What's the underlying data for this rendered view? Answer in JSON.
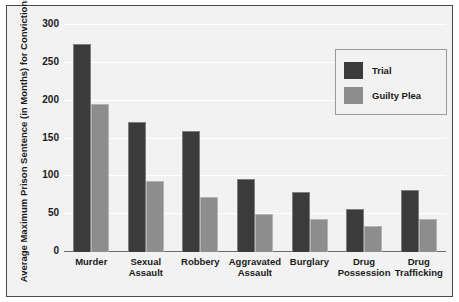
{
  "chart_data": {
    "type": "bar",
    "title": "",
    "xlabel": "",
    "ylabel": "Average Maximum Prison Sentence (in Months) for Convictions",
    "ylim": [
      0,
      300
    ],
    "ytick_step": 50,
    "yticks": [
      0,
      50,
      100,
      150,
      200,
      250,
      300
    ],
    "ytick_labels": [
      "0",
      "50",
      "100",
      "150",
      "200",
      "250",
      "300"
    ],
    "grid": true,
    "grid_axis": "y",
    "legend_position": "top-right",
    "categories": [
      "Murder",
      "Sexual Assault",
      "Robbery",
      "Aggravated Assault",
      "Burglary",
      "Drug Possession",
      "Drug Trafficking"
    ],
    "category_lines": [
      [
        "Murder"
      ],
      [
        "Sexual",
        "Assault"
      ],
      [
        "Robbery"
      ],
      [
        "Aggravated",
        "Assault"
      ],
      [
        "Burglary"
      ],
      [
        "Drug",
        "Possession"
      ],
      [
        "Drug",
        "Trafficking"
      ]
    ],
    "series": [
      {
        "name": "Trial",
        "color": "#3b3b3b",
        "values": [
          275,
          172,
          160,
          97,
          79,
          57,
          82
        ]
      },
      {
        "name": "Guilty Plea",
        "color": "#8d8d8d",
        "values": [
          195,
          94,
          73,
          50,
          44,
          34,
          44
        ]
      }
    ]
  },
  "legend": {
    "items": [
      {
        "label": "Trial",
        "color": "#3b3b3b"
      },
      {
        "label": "Guilty Plea",
        "color": "#8d8d8d"
      }
    ]
  },
  "colors": {
    "background": "#f2f2f2",
    "frame_border": "#4a4a4a",
    "gridline": "#ffffff",
    "axis": "#6a6a6a",
    "text": "#1a1a1a",
    "trial": "#3b3b3b",
    "guilty_plea": "#8d8d8d"
  }
}
